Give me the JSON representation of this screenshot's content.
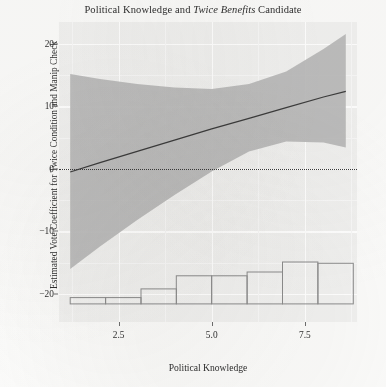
{
  "chart_data": {
    "type": "line",
    "title": "Political Knowledge and Twice Benefits Candidate",
    "title_plain": "Political Knowledge and ",
    "title_italic": "Twice Benefits",
    "title_tail": " Candidate",
    "xlabel": "Political Knowledge",
    "ylabel": "Estimated Vote Coefficient for Twice Condition and Manip Check",
    "xlim": [
      0.9,
      8.9
    ],
    "ylim": [
      -24.5,
      23.5
    ],
    "xticks": [
      2.5,
      5.0,
      7.5
    ],
    "xtick_labels": [
      "2.5",
      "5.0",
      "7.5"
    ],
    "yticks": [
      20,
      10,
      0,
      -10,
      -20
    ],
    "ytick_labels": [
      "20",
      "10",
      "0",
      "-10",
      "-20"
    ],
    "grid": "white major and minor gridlines on light gray panel",
    "legend": "none",
    "zero_reference_line": 0,
    "series": [
      {
        "name": "Marginal effect (linear fit)",
        "type": "line",
        "x": [
          1.2,
          2.0,
          3.0,
          4.0,
          5.0,
          6.0,
          7.0,
          8.0,
          8.6
        ],
        "values": [
          -0.5,
          1.0,
          2.8,
          4.6,
          6.4,
          8.1,
          9.8,
          11.5,
          12.4
        ]
      },
      {
        "name": "95% confidence band upper",
        "type": "line",
        "x": [
          1.2,
          2.0,
          3.0,
          4.0,
          5.0,
          6.0,
          7.0,
          8.0,
          8.6
        ],
        "values": [
          15.2,
          14.4,
          13.6,
          13.0,
          12.8,
          13.6,
          15.6,
          19.2,
          21.6
        ]
      },
      {
        "name": "95% confidence band lower",
        "type": "line",
        "x": [
          1.2,
          2.0,
          3.0,
          4.0,
          5.0,
          6.0,
          7.0,
          8.0,
          8.6
        ],
        "values": [
          -16.0,
          -12.4,
          -8.2,
          -4.2,
          -0.4,
          2.8,
          4.4,
          4.2,
          3.4
        ]
      }
    ],
    "histogram": {
      "name": "Distribution of Political Knowledge",
      "type": "bar",
      "baseline": -21.6,
      "bin_edges": [
        1.2,
        2.15,
        3.1,
        4.05,
        5.0,
        5.95,
        6.9,
        7.85,
        8.8
      ],
      "bin_centers": [
        1.68,
        2.63,
        3.58,
        4.53,
        5.48,
        6.43,
        7.38,
        8.33
      ],
      "bar_tops": [
        -20.6,
        -20.6,
        -19.2,
        -17.1,
        -17.1,
        -16.5,
        -14.9,
        -15.1
      ],
      "values": [
        1.0,
        1.0,
        2.4,
        4.5,
        4.5,
        5.1,
        6.7,
        6.5
      ]
    },
    "colors": {
      "panel_background": "#f1f1f0",
      "gridline": "#ffffff",
      "confidence_band": "#b9b9b9",
      "fit_line": "#3c3c3c",
      "zero_line": "#3a3a3a",
      "histogram_outline": "#8c8c8c",
      "histogram_fill": "#f1f1f0",
      "text": "#2e2e2e"
    }
  }
}
